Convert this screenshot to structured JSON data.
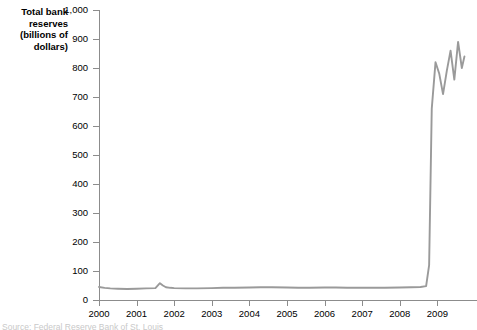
{
  "axis_title": "Total bank\nreserves\n(billions of\ndollars)",
  "source_note": "Source: Federal Reserve Bank of St. Louis",
  "chart_data": {
    "type": "line",
    "title": "Total bank reserves (billions of dollars)",
    "xlabel": "",
    "ylabel": "Total bank reserves (billions of dollars)",
    "xlim": [
      2000,
      2009.75
    ],
    "ylim": [
      0,
      1000
    ],
    "grid": false,
    "legend": null,
    "line_color": "#9a9a9a",
    "axis_color": "#8c8c8c",
    "x_tick_labels": [
      "2000",
      "2001",
      "2002",
      "2003",
      "2004",
      "2005",
      "2006",
      "2007",
      "2008",
      "2009"
    ],
    "x_ticks": [
      2000,
      2001,
      2002,
      2003,
      2004,
      2005,
      2006,
      2007,
      2008,
      2009
    ],
    "y_tick_labels": [
      "0",
      "100",
      "200",
      "300",
      "400",
      "500",
      "600",
      "700",
      "800",
      "900",
      "1,000"
    ],
    "y_ticks": [
      0,
      100,
      200,
      300,
      400,
      500,
      600,
      700,
      800,
      900,
      1000
    ],
    "series": [
      {
        "name": "Total bank reserves",
        "x": [
          2000.0,
          2000.15,
          2000.3,
          2000.5,
          2000.75,
          2001.0,
          2001.25,
          2001.5,
          2001.62,
          2001.7,
          2001.78,
          2001.9,
          2002.0,
          2002.3,
          2002.6,
          2003.0,
          2003.3,
          2003.6,
          2004.0,
          2004.3,
          2004.6,
          2005.0,
          2005.3,
          2005.6,
          2006.0,
          2006.3,
          2006.6,
          2007.0,
          2007.3,
          2007.6,
          2008.0,
          2008.3,
          2008.55,
          2008.7,
          2008.78,
          2008.85,
          2008.95,
          2009.05,
          2009.15,
          2009.25,
          2009.35,
          2009.45,
          2009.55,
          2009.65,
          2009.72
        ],
        "y": [
          45,
          42,
          40,
          39,
          38,
          39,
          40,
          41,
          58,
          50,
          44,
          42,
          41,
          40,
          40,
          41,
          42,
          42,
          43,
          44,
          44,
          43,
          42,
          42,
          43,
          43,
          42,
          42,
          42,
          42,
          43,
          44,
          45,
          48,
          120,
          660,
          820,
          780,
          710,
          790,
          860,
          760,
          890,
          800,
          840
        ]
      }
    ],
    "annotations": []
  }
}
